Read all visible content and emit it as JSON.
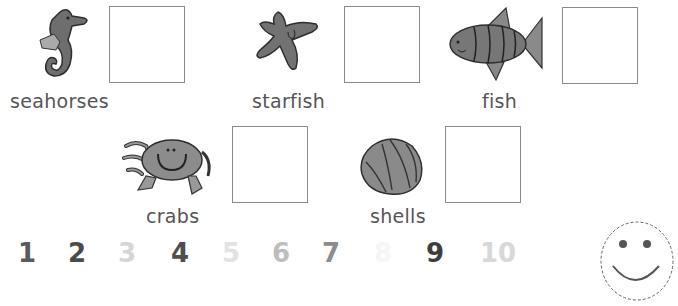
{
  "items": [
    {
      "label": "seahorses",
      "icon": "seahorse-icon"
    },
    {
      "label": "starfish",
      "icon": "starfish-icon"
    },
    {
      "label": "fish",
      "icon": "fish-icon"
    },
    {
      "label": "crabs",
      "icon": "crab-icon"
    },
    {
      "label": "shells",
      "icon": "shell-icon"
    }
  ],
  "numbers": [
    {
      "value": "1",
      "color": "#5a5a5a"
    },
    {
      "value": "2",
      "color": "#4a4a4a"
    },
    {
      "value": "3",
      "color": "#d6d6d6"
    },
    {
      "value": "4",
      "color": "#4f4f4f"
    },
    {
      "value": "5",
      "color": "#e2e2e2"
    },
    {
      "value": "6",
      "color": "#bdbdbd"
    },
    {
      "value": "7",
      "color": "#8c8c8c"
    },
    {
      "value": "8",
      "color": "#f6f6f6"
    },
    {
      "value": "9",
      "color": "#3e3e3e"
    },
    {
      "value": "10",
      "color": "#d8d8d8"
    }
  ],
  "smiley": {
    "icon": "smiley-face-icon"
  }
}
